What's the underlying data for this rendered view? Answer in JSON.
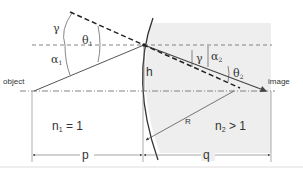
{
  "diagram": {
    "labels": {
      "object": "object",
      "image": "image",
      "gamma_top": "γ",
      "theta1": "θ",
      "theta1_sub": "1",
      "alpha1": "α",
      "alpha1_sub": "1",
      "h": "h",
      "gamma_right": "γ",
      "alpha2": "α",
      "alpha2_sub": "2",
      "theta2": "θ",
      "theta2_sub": "2",
      "R": "R",
      "n1": "n",
      "n1_sub": "1",
      "n1_rel": " = 1",
      "n2": "n",
      "n2_sub": "2",
      "n2_rel": " > 1",
      "p": "p",
      "q": "q"
    },
    "colors": {
      "line": "#444444",
      "medium2_fill": "#eeeeee",
      "dashed": "#333333",
      "axis": "#666666"
    }
  }
}
